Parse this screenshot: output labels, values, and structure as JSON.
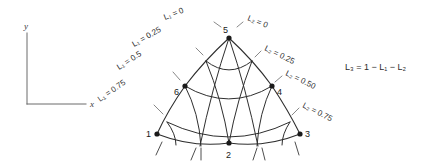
{
  "figure": {
    "title": "",
    "axes": {
      "x_label": "x",
      "y_label": "y"
    },
    "equation": "L₃ = 1 − L₁ − L₂",
    "nodes": [
      {
        "id": "node-1",
        "label": "1",
        "x": 157,
        "y": 134
      },
      {
        "id": "node-2",
        "label": "2",
        "x": 229,
        "y": 143
      },
      {
        "id": "node-3",
        "label": "3",
        "x": 300,
        "y": 134
      },
      {
        "id": "node-4",
        "label": "4",
        "x": 272,
        "y": 86
      },
      {
        "id": "node-5",
        "label": "5",
        "x": 229,
        "y": 38
      },
      {
        "id": "node-6",
        "label": "6",
        "x": 185,
        "y": 86
      }
    ],
    "left_contours": [
      {
        "label": "L₁ = 0",
        "value": "0"
      },
      {
        "label": "L₁ = 0.25",
        "value": "0.25"
      },
      {
        "label": "L₁ = 0.5",
        "value": "0.5"
      },
      {
        "label": "L₁ = 0.75",
        "value": "0.75"
      }
    ],
    "right_contours": [
      {
        "label": "L₂ = 0",
        "value": "0"
      },
      {
        "label": "L₂ = 0.25",
        "value": "0.25"
      },
      {
        "label": "L₂ = 0.50",
        "value": "0.50"
      },
      {
        "label": "L₂ = 0.75",
        "value": "0.75"
      }
    ],
    "colors": {
      "stroke": "#2e2e2e",
      "text": "#2b2b2b",
      "axis": "#6a6a6a",
      "background": "#ffffff"
    }
  }
}
